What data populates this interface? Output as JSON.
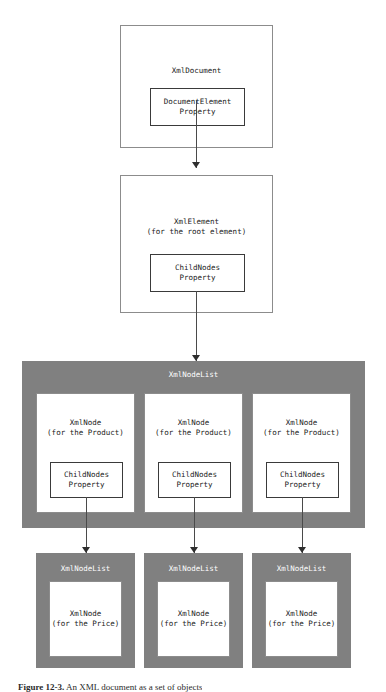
{
  "figure": {
    "caption_label": "Figure 12-3.",
    "caption_text": " An XML document as a set of objects",
    "background_color": "#ffffff",
    "container_color": "#808080",
    "box_border_color": "#8c8c8c",
    "inner_border_color": "#3a3a3a",
    "connector_color": "#4a4a4a"
  },
  "nodes": {
    "document": {
      "title": "XmlDocument",
      "property": "DocumentElement\nProperty"
    },
    "element": {
      "title": "XmlElement\n(for the root element)",
      "property": "ChildNodes\nProperty"
    },
    "nodelist_root": {
      "title": "XmlNodeList"
    },
    "product_nodes": [
      {
        "title": "XmlNode\n(for the Product)",
        "property": "ChildNodes\nProperty"
      },
      {
        "title": "XmlNode\n(for the Product)",
        "property": "ChildNodes\nProperty"
      },
      {
        "title": "XmlNode\n(for the Product)",
        "property": "ChildNodes\nProperty"
      }
    ],
    "price_lists": [
      {
        "title": "XmlNodeList",
        "child": "XmlNode\n(for the Price)"
      },
      {
        "title": "XmlNodeList",
        "child": "XmlNode\n(for the Price)"
      },
      {
        "title": "XmlNodeList",
        "child": "XmlNode\n(for the Price)"
      }
    ]
  }
}
